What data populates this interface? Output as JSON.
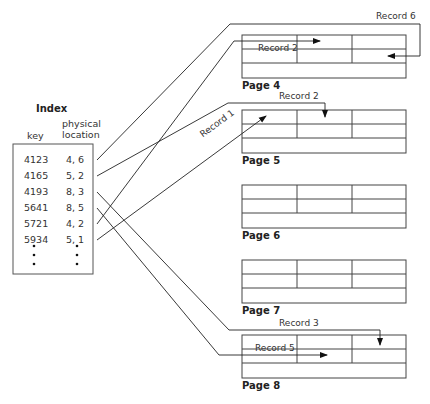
{
  "index": {
    "title": "Index",
    "columns": [
      "key",
      "physical",
      "location"
    ],
    "rows": [
      {
        "key": "4123",
        "location": "4, 6"
      },
      {
        "key": "4165",
        "location": "5, 2"
      },
      {
        "key": "4193",
        "location": "8, 3"
      },
      {
        "key": "5641",
        "location": "8, 5"
      },
      {
        "key": "5721",
        "location": "4, 2"
      },
      {
        "key": "5934",
        "location": "5, 1"
      }
    ]
  },
  "pages": [
    {
      "label": "Page 4"
    },
    {
      "label": "Page 5"
    },
    {
      "label": "Page 6"
    },
    {
      "label": "Page 7"
    },
    {
      "label": "Page 8"
    }
  ],
  "records": {
    "r6": "Record 6",
    "r2_p4": "Record 2",
    "r2_p5": "Record 2",
    "r1": "Record 1",
    "r3": "Record 3",
    "r5": "Record 5"
  }
}
